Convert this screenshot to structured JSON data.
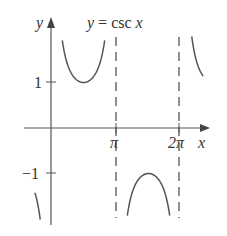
{
  "chart_data": {
    "type": "line",
    "xlabel": "x",
    "ylabel": "y",
    "x_ticks": [
      {
        "value": 3.14159,
        "label": "π"
      },
      {
        "value": 6.28319,
        "label": "2π"
      }
    ],
    "y_ticks": [
      {
        "value": 1,
        "label": "1"
      },
      {
        "value": -1,
        "label": "−1"
      }
    ],
    "xlim": [
      -0.5,
      2.4
    ],
    "ylim": [
      -2,
      2
    ],
    "asymptotes": [
      3.14159,
      6.28319
    ],
    "series": [
      {
        "name": "csc x",
        "x_range": [
          0.52,
          3.14159
        ],
        "note": "branch above, min at (π/2, 1)"
      },
      {
        "name": "csc x",
        "x_range": [
          3.14159,
          6.28319
        ],
        "note": "branch below, max at (3π/2, −1)"
      },
      {
        "name": "csc x",
        "x_range": [
          6.28319,
          6.9
        ],
        "note": "branch above, partial"
      },
      {
        "name": "csc x",
        "x_range": [
          -0.55,
          0
        ],
        "note": "branch below, partial"
      }
    ],
    "grid": false
  },
  "labels": {
    "y_axis": "y",
    "x_axis": "x",
    "tick_pi": "π",
    "tick_2pi": "2π",
    "tick_one": "1",
    "tick_neg_one": "−1"
  },
  "colors": {
    "curve": "#555555",
    "axis": "#555555",
    "text": "#333333"
  }
}
